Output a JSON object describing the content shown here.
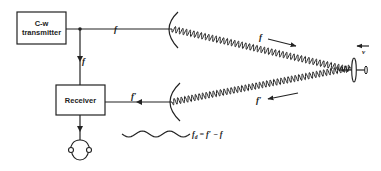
{
  "diagram": {
    "blocks": {
      "transmitter": {
        "line1": "C-w",
        "line2": "transmitter"
      },
      "receiver": {
        "label": "Receiver"
      }
    },
    "labels": {
      "tx_line_freq": "f",
      "tx_to_rx_freq": "f",
      "rx_line_freq": "f′",
      "outgoing_wave_freq": "f",
      "returning_wave_freq": "f′",
      "target_velocity": "v",
      "doppler_formula_lhs": "f",
      "doppler_formula_sub": "d",
      "doppler_formula_rhs": " = f′ − f"
    },
    "icons": [
      "transmit-dish-icon",
      "receive-dish-icon",
      "aircraft-icon",
      "headphones-icon"
    ],
    "colors": {
      "ink": "#222222",
      "background": "#ffffff"
    }
  }
}
